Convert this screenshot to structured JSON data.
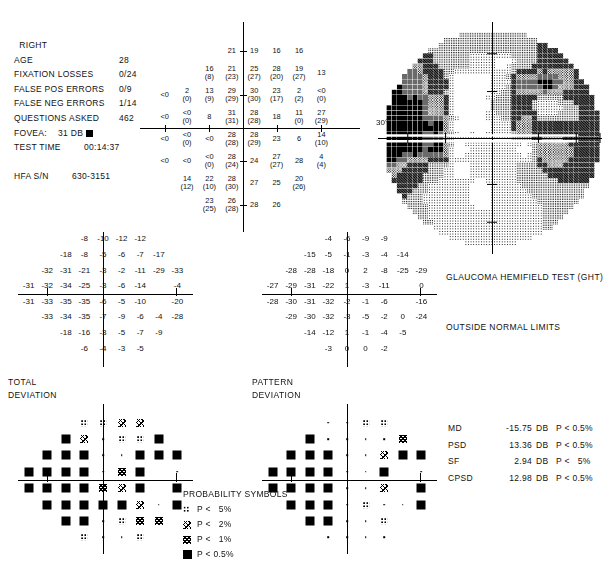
{
  "report": {
    "eye": "RIGHT",
    "fields": [
      {
        "label": "AGE",
        "value": "28"
      },
      {
        "label": "FIXATION LOSSES",
        "value": "0/24"
      },
      {
        "label": "FALSE POS ERRORS",
        "value": "0/9"
      },
      {
        "label": "FALSE NEG ERRORS",
        "value": "1/14"
      },
      {
        "label": "QUESTIONS ASKED",
        "value": "462"
      },
      {
        "label": "FOVEA:",
        "value": "31 DB"
      },
      {
        "label": "TEST TIME",
        "value": "00:14:37"
      },
      {
        "label": "HFA S/N",
        "value": "630-3151"
      }
    ],
    "fovea_marker": "filled-square"
  },
  "grayscale": {
    "axis_label": "30°"
  },
  "ght": {
    "title": "GLAUCOMA HEMIFIELD TEST (GHT)",
    "result": "OUTSIDE NORMAL LIMITS"
  },
  "captions": {
    "total_deviation": "TOTAL\nDEVIATION",
    "pattern_deviation": "PATTERN\nDEVIATION"
  },
  "legend": {
    "title": "PROBABILITY SYMBOLS",
    "entries": [
      {
        "symbol": "p5",
        "text": "P <   5%"
      },
      {
        "symbol": "p2",
        "text": "P <   2%"
      },
      {
        "symbol": "p1",
        "text": "P <   1%"
      },
      {
        "symbol": "p05",
        "text": "P < 0.5%"
      }
    ]
  },
  "global_indices": {
    "rows": [
      {
        "name": "MD",
        "value": "-15.75",
        "unit": "DB",
        "prob": "P < 0.5%"
      },
      {
        "name": "PSD",
        "value": "13.36",
        "unit": "DB",
        "prob": "P < 0.5%"
      },
      {
        "name": "SF",
        "value": "2.94",
        "unit": "DB",
        "prob": "P <   5%"
      },
      {
        "name": "CPSD",
        "value": "12.98",
        "unit": "DB",
        "prob": "P < 0.5%"
      }
    ]
  },
  "chart_data": {
    "type": "table",
    "threshold_grid": {
      "description": "Measured sensitivity in dB at each test location; value in parentheses is the retest value where present. Column index 0 is most nasal-left (-27 deg) through 9 (+27 deg); row index 0 is top (+27 deg).",
      "x_deg": [
        -27,
        -21,
        -15,
        -9,
        -3,
        3,
        9,
        15,
        21,
        27
      ],
      "y_deg": [
        27,
        21,
        15,
        9,
        3,
        -3,
        -9,
        -15,
        -21,
        -27
      ],
      "points": [
        {
          "row": 0,
          "col": 3,
          "main": "21",
          "retest": null
        },
        {
          "row": 0,
          "col": 4,
          "main": "19",
          "retest": null
        },
        {
          "row": 0,
          "col": 5,
          "main": "16",
          "retest": null
        },
        {
          "row": 0,
          "col": 6,
          "main": "16",
          "retest": null
        },
        {
          "row": 1,
          "col": 2,
          "main": "16",
          "retest": "8"
        },
        {
          "row": 1,
          "col": 3,
          "main": "21",
          "retest": "23"
        },
        {
          "row": 1,
          "col": 4,
          "main": "25",
          "retest": "27"
        },
        {
          "row": 1,
          "col": 5,
          "main": "28",
          "retest": "20"
        },
        {
          "row": 1,
          "col": 6,
          "main": "19",
          "retest": "27"
        },
        {
          "row": 1,
          "col": 7,
          "main": "13",
          "retest": null
        },
        {
          "row": 2,
          "col": 0,
          "main": "<0",
          "retest": null
        },
        {
          "row": 2,
          "col": 1,
          "main": "2",
          "retest": "0"
        },
        {
          "row": 2,
          "col": 2,
          "main": "13",
          "retest": "9"
        },
        {
          "row": 2,
          "col": 3,
          "main": "29",
          "retest": "29"
        },
        {
          "row": 2,
          "col": 4,
          "main": "30",
          "retest": "30"
        },
        {
          "row": 2,
          "col": 5,
          "main": "23",
          "retest": "17"
        },
        {
          "row": 2,
          "col": 6,
          "main": "2",
          "retest": "2"
        },
        {
          "row": 2,
          "col": 7,
          "main": "<0",
          "retest": "0"
        },
        {
          "row": 3,
          "col": 0,
          "main": "<0",
          "retest": null
        },
        {
          "row": 3,
          "col": 1,
          "main": "<0",
          "retest": "0"
        },
        {
          "row": 3,
          "col": 2,
          "main": "8",
          "retest": null
        },
        {
          "row": 3,
          "col": 3,
          "main": "31",
          "retest": "31"
        },
        {
          "row": 3,
          "col": 4,
          "main": "28",
          "retest": "28"
        },
        {
          "row": 3,
          "col": 5,
          "main": "18",
          "retest": null
        },
        {
          "row": 3,
          "col": 6,
          "main": "11",
          "retest": "0"
        },
        {
          "row": 3,
          "col": 7,
          "main": "27",
          "retest": "29"
        },
        {
          "row": 4,
          "col": 0,
          "main": "<0",
          "retest": null
        },
        {
          "row": 4,
          "col": 1,
          "main": "<0",
          "retest": "0"
        },
        {
          "row": 4,
          "col": 2,
          "main": "<0",
          "retest": null
        },
        {
          "row": 4,
          "col": 3,
          "main": "28",
          "retest": "28"
        },
        {
          "row": 4,
          "col": 4,
          "main": "28",
          "retest": "29"
        },
        {
          "row": 4,
          "col": 5,
          "main": "23",
          "retest": null
        },
        {
          "row": 4,
          "col": 6,
          "main": "6",
          "retest": null
        },
        {
          "row": 4,
          "col": 7,
          "main": "14",
          "retest": "10"
        },
        {
          "row": 5,
          "col": 0,
          "main": "<0",
          "retest": null
        },
        {
          "row": 5,
          "col": 1,
          "main": "<0",
          "retest": null
        },
        {
          "row": 5,
          "col": 2,
          "main": "<0",
          "retest": "0"
        },
        {
          "row": 5,
          "col": 3,
          "main": "28",
          "retest": "24"
        },
        {
          "row": 5,
          "col": 4,
          "main": "24",
          "retest": null
        },
        {
          "row": 5,
          "col": 5,
          "main": "27",
          "retest": "27"
        },
        {
          "row": 5,
          "col": 6,
          "main": "28",
          "retest": null
        },
        {
          "row": 5,
          "col": 7,
          "main": "4",
          "retest": "4"
        },
        {
          "row": 6,
          "col": 1,
          "main": "14",
          "retest": "12"
        },
        {
          "row": 6,
          "col": 2,
          "main": "22",
          "retest": "10"
        },
        {
          "row": 6,
          "col": 3,
          "main": "28",
          "retest": "30"
        },
        {
          "row": 6,
          "col": 4,
          "main": "27",
          "retest": null
        },
        {
          "row": 6,
          "col": 5,
          "main": "25",
          "retest": null
        },
        {
          "row": 6,
          "col": 6,
          "main": "20",
          "retest": "26"
        },
        {
          "row": 7,
          "col": 2,
          "main": "23",
          "retest": "25"
        },
        {
          "row": 7,
          "col": 3,
          "main": "26",
          "retest": "28"
        },
        {
          "row": 7,
          "col": 4,
          "main": "28",
          "retest": null
        },
        {
          "row": 7,
          "col": 5,
          "main": "26",
          "retest": null
        }
      ]
    },
    "total_deviation_values": {
      "description": "Total deviation in dB relative to age-matched normals",
      "rows": [
        {
          "row": 0,
          "cols": {
            "3": "-8",
            "4": "-10",
            "5": "-12",
            "6": "-12"
          }
        },
        {
          "row": 1,
          "cols": {
            "2": "-18",
            "3": "-8",
            "4": "-5",
            "5": "-6",
            "6": "-7",
            "7": "-17"
          }
        },
        {
          "row": 2,
          "cols": {
            "1": "-32",
            "2": "-31",
            "3": "-21",
            "4": "-3",
            "5": "-2",
            "6": "-11",
            "7": "-29",
            "8": "-33"
          }
        },
        {
          "row": 3,
          "cols": {
            "0": "-31",
            "1": "-32",
            "2": "-34",
            "3": "-25",
            "4": "-3",
            "5": "-6",
            "6": "-14",
            "8": "-4"
          }
        },
        {
          "row": 4,
          "cols": {
            "0": "-31",
            "1": "-33",
            "2": "-35",
            "3": "-35",
            "4": "-6",
            "5": "-5",
            "6": "-10",
            "8": "-20"
          }
        },
        {
          "row": 5,
          "cols": {
            "1": "-33",
            "2": "-34",
            "3": "-35",
            "4": "-7",
            "5": "-9",
            "6": "-6",
            "7": "-4",
            "8": "-28"
          }
        },
        {
          "row": 6,
          "cols": {
            "2": "-18",
            "3": "-16",
            "4": "-3",
            "5": "-5",
            "6": "-7",
            "7": "-9"
          }
        },
        {
          "row": 7,
          "cols": {
            "3": "-6",
            "4": "-4",
            "5": "-3",
            "6": "-5"
          }
        }
      ]
    },
    "pattern_deviation_values": {
      "description": "Pattern deviation in dB after correction for overall height",
      "rows": [
        {
          "row": 0,
          "cols": {
            "3": "-4",
            "4": "-6",
            "5": "-9",
            "6": "-9"
          }
        },
        {
          "row": 1,
          "cols": {
            "2": "-15",
            "3": "-5",
            "4": "-1",
            "5": "-3",
            "6": "-4",
            "7": "-14"
          }
        },
        {
          "row": 2,
          "cols": {
            "1": "-28",
            "2": "-28",
            "3": "-18",
            "4": "0",
            "5": "2",
            "6": "-8",
            "7": "-25",
            "8": "-29"
          }
        },
        {
          "row": 3,
          "cols": {
            "0": "-27",
            "1": "-29",
            "2": "-31",
            "3": "-22",
            "4": "1",
            "5": "-3",
            "6": "-11",
            "8": "0"
          }
        },
        {
          "row": 4,
          "cols": {
            "0": "-28",
            "1": "-30",
            "2": "-31",
            "3": "-32",
            "4": "-2",
            "5": "-1",
            "6": "-6",
            "8": "-16"
          }
        },
        {
          "row": 5,
          "cols": {
            "1": "-29",
            "2": "-30",
            "3": "-32",
            "4": "-3",
            "5": "-5",
            "6": "-2",
            "7": "0",
            "8": "-24"
          }
        },
        {
          "row": 6,
          "cols": {
            "2": "-14",
            "3": "-12",
            "4": "1",
            "5": "-1",
            "6": "-4",
            "7": "-5"
          }
        },
        {
          "row": 7,
          "cols": {
            "3": "-3",
            "4": "0",
            "5": "0",
            "6": "-2"
          }
        }
      ]
    },
    "total_deviation_symbols": {
      "description": "Probability symbol per location: dot=within normal, p5/p2/p1/p05 = significance levels",
      "rows": [
        {
          "row": 0,
          "cols": {
            "3": "p5",
            "4": "p5",
            "5": "p2",
            "6": "p2"
          }
        },
        {
          "row": 1,
          "cols": {
            "2": "p05",
            "3": "p2",
            "4": "dot",
            "5": "p5",
            "6": "p5",
            "7": "p05"
          }
        },
        {
          "row": 2,
          "cols": {
            "1": "p05",
            "2": "p05",
            "3": "p05",
            "4": "dot",
            "5": "dot",
            "6": "p05",
            "7": "p05",
            "8": "p05"
          }
        },
        {
          "row": 3,
          "cols": {
            "0": "p05",
            "1": "p05",
            "2": "p05",
            "3": "p05",
            "4": "dot",
            "5": "p1",
            "6": "p05",
            "8": "dot"
          }
        },
        {
          "row": 4,
          "cols": {
            "0": "p05",
            "1": "p05",
            "2": "p05",
            "3": "p05",
            "4": "p1",
            "5": "p2",
            "6": "p05",
            "8": "p05"
          }
        },
        {
          "row": 5,
          "cols": {
            "1": "p05",
            "2": "p05",
            "3": "p05",
            "4": "p05",
            "5": "p05",
            "6": "p2",
            "7": "dot",
            "8": "p05"
          }
        },
        {
          "row": 6,
          "cols": {
            "2": "p05",
            "3": "p05",
            "4": "dot",
            "5": "p5",
            "6": "p1",
            "7": "p1"
          }
        },
        {
          "row": 7,
          "cols": {
            "3": "p5",
            "4": "dot",
            "5": "dot",
            "6": "p5"
          }
        }
      ]
    },
    "pattern_deviation_symbols": {
      "rows": [
        {
          "row": 0,
          "cols": {
            "3": "dot",
            "4": "dot",
            "5": "p5",
            "6": "p5"
          }
        },
        {
          "row": 1,
          "cols": {
            "2": "p05",
            "3": "dot",
            "4": "dot",
            "5": "dot",
            "6": "dot",
            "7": "p1"
          }
        },
        {
          "row": 2,
          "cols": {
            "1": "p05",
            "2": "p05",
            "3": "p05",
            "4": "dot",
            "5": "dot",
            "6": "p2",
            "7": "p05",
            "8": "p05"
          }
        },
        {
          "row": 3,
          "cols": {
            "0": "p05",
            "1": "p05",
            "2": "p05",
            "3": "p05",
            "4": "dot",
            "5": "dot",
            "6": "p05",
            "8": "dot"
          }
        },
        {
          "row": 4,
          "cols": {
            "0": "p05",
            "1": "p05",
            "2": "p05",
            "3": "p05",
            "4": "dot",
            "5": "dot",
            "6": "p2",
            "8": "p05"
          }
        },
        {
          "row": 5,
          "cols": {
            "1": "p05",
            "2": "p05",
            "3": "p05",
            "4": "dot",
            "5": "p5",
            "6": "dot",
            "7": "dot",
            "8": "p05"
          }
        },
        {
          "row": 6,
          "cols": {
            "2": "p05",
            "3": "p05",
            "4": "dot",
            "5": "dot",
            "6": "p5"
          }
        },
        {
          "row": 7,
          "cols": {
            "3": "dot",
            "4": "dot",
            "5": "dot",
            "6": "dot"
          }
        }
      ]
    }
  }
}
